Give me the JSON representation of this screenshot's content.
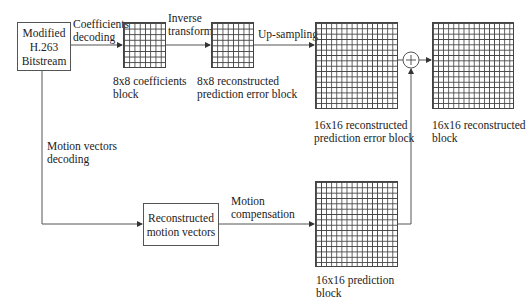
{
  "diagram": {
    "nodes": {
      "bitstream": {
        "lines": [
          "Modified",
          "H.263",
          "Bitstream"
        ]
      },
      "motion_vectors_box": {
        "lines": [
          "Reconstructed",
          "motion vectors"
        ]
      },
      "adder": {
        "symbol": "+"
      }
    },
    "blocks": {
      "coefficients_8x8": {
        "lines": [
          "8x8 coefficients",
          "block"
        ],
        "grid": "8x8"
      },
      "recon_error_8x8": {
        "lines": [
          "8x8 reconstructed",
          "prediction error block"
        ],
        "grid": "8x8"
      },
      "recon_error_16x16": {
        "lines": [
          "16x16 reconstructed",
          "prediction error block"
        ],
        "grid": "16x16"
      },
      "reconstructed_16x16": {
        "lines": [
          "16x16 reconstructed",
          "block"
        ],
        "grid": "16x16"
      },
      "prediction_16x16": {
        "lines": [
          "16x16 prediction",
          "block"
        ],
        "grid": "16x16"
      }
    },
    "edges": {
      "coefficients_decoding": {
        "lines": [
          "Coefficients",
          "decoding"
        ]
      },
      "inverse_transform": {
        "lines": [
          "Inverse",
          "transform"
        ]
      },
      "up_sampling": {
        "lines": [
          "Up-sampling"
        ]
      },
      "motion_vectors_decoding": {
        "lines": [
          "Motion vectors",
          "decoding"
        ]
      },
      "motion_compensation": {
        "lines": [
          "Motion",
          "compensation"
        ]
      }
    }
  }
}
